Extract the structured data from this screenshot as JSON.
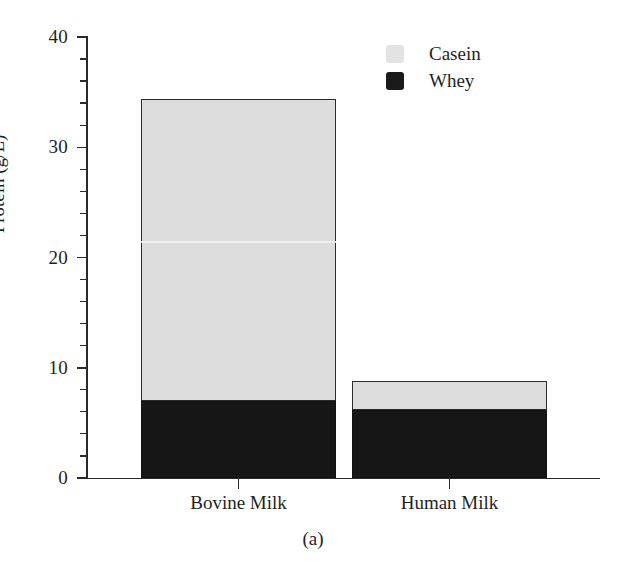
{
  "chart_data": {
    "type": "bar",
    "subtype": "stacked-vertical",
    "title": "",
    "caption": "(a)",
    "xlabel": "",
    "ylabel": "Protein (g/L)",
    "categories": [
      "Bovine Milk",
      "Human Milk"
    ],
    "series": [
      {
        "name": "Whey",
        "values": [
          7.0,
          6.2
        ],
        "color": "#161616"
      },
      {
        "name": "Casein",
        "values": [
          27.4,
          2.6
        ],
        "color": "#dcdcdc"
      }
    ],
    "totals": [
      34.4,
      8.8
    ],
    "stack_order_bottom_to_top": [
      "Whey",
      "Casein"
    ],
    "ylim": [
      0,
      40
    ],
    "y_major_ticks": [
      0,
      10,
      20,
      30,
      40
    ],
    "y_major_tick_labels": [
      "0",
      "10",
      "20",
      "30",
      "40"
    ],
    "y_minor_tick_interval": 2,
    "grid": false,
    "legend": {
      "position": "top-right",
      "entries": [
        {
          "label": "Casein",
          "swatch": "casein-swatch"
        },
        {
          "label": "Whey",
          "swatch": "whey-swatch"
        }
      ]
    },
    "axes": {
      "left_spine": true,
      "bottom_spine": true,
      "top_spine": false,
      "right_spine": false,
      "tick_direction": "out"
    }
  },
  "colors": {
    "casein": "#dcdcdc",
    "whey": "#161616",
    "axis": "#2a2a2a",
    "text": "#1f1f1f",
    "background": "#ffffff"
  }
}
